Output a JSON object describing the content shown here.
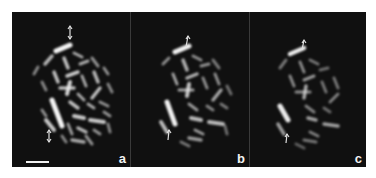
{
  "figure": {
    "background": "#101010",
    "chromosome_color": "#e6e6e6",
    "panels": [
      {
        "id": "a",
        "label": "a",
        "left": 0,
        "width": 118,
        "brightness": 1.0,
        "arrows": "double"
      },
      {
        "id": "b",
        "label": "b",
        "left": 118,
        "width": 119,
        "brightness": 0.85,
        "arrows": "single"
      },
      {
        "id": "c",
        "label": "c",
        "left": 237,
        "width": 117,
        "brightness": 0.7,
        "arrows": "single"
      }
    ],
    "scale_bar": {
      "panel": "a",
      "x": 14,
      "y": 149,
      "length": 23
    }
  }
}
